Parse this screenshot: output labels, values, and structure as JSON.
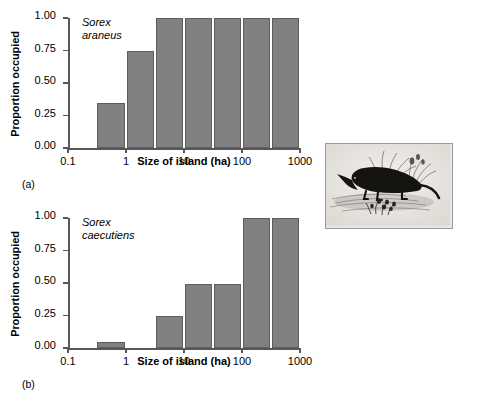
{
  "figure": {
    "panels": [
      {
        "letter": "(a)",
        "species_line1": "Sorex",
        "species_line2": "araneus",
        "xlabel": "Size of island (ha)",
        "ylabel": "Proportion occupied"
      },
      {
        "letter": "(b)",
        "species_line1": "Sorex",
        "species_line2": "caecutiens",
        "xlabel": "Size of island (ha)",
        "ylabel": "Proportion occupied"
      }
    ],
    "illustration": {
      "caption": "shrew-illustration"
    }
  },
  "chart_data": [
    {
      "type": "bar",
      "title": "Sorex araneus",
      "xlabel": "Size of island (ha)",
      "ylabel": "Proportion occupied",
      "xscale": "log",
      "xlim": [
        0.1,
        1000
      ],
      "ylim": [
        0.0,
        1.0
      ],
      "grid": false,
      "xticks": [
        0.1,
        1,
        10,
        100,
        1000
      ],
      "xtick_labels": [
        "0.1",
        "1",
        "10",
        "100",
        "1000"
      ],
      "yticks": [
        0.0,
        0.25,
        0.5,
        0.75,
        1.0
      ],
      "ytick_labels": [
        "0.00",
        "0.25",
        "0.50",
        "0.75",
        "1.00"
      ],
      "bins": [
        {
          "label": "0.3-1",
          "x_start": 0.3,
          "x_end": 1.0
        },
        {
          "label": "1-3",
          "x_start": 1.0,
          "x_end": 3.2
        },
        {
          "label": "3-10",
          "x_start": 3.2,
          "x_end": 10.0
        },
        {
          "label": "10-32",
          "x_start": 10.0,
          "x_end": 32.0
        },
        {
          "label": "32-100",
          "x_start": 32.0,
          "x_end": 100.0
        },
        {
          "label": "100-320",
          "x_start": 100.0,
          "x_end": 320.0
        },
        {
          "label": "320-1000",
          "x_start": 320.0,
          "x_end": 1000.0
        }
      ],
      "values": [
        0.35,
        0.75,
        1.0,
        1.0,
        1.0,
        1.0,
        1.0
      ],
      "bar_color": "#808082",
      "bar_edge_color": "#5d5d5f"
    },
    {
      "type": "bar",
      "title": "Sorex caecutiens",
      "xlabel": "Size of island (ha)",
      "ylabel": "Proportion occupied",
      "xscale": "log",
      "xlim": [
        0.1,
        1000
      ],
      "ylim": [
        0.0,
        1.0
      ],
      "grid": false,
      "xticks": [
        0.1,
        1,
        10,
        100,
        1000
      ],
      "xtick_labels": [
        "0.1",
        "1",
        "10",
        "100",
        "1000"
      ],
      "yticks": [
        0.0,
        0.25,
        0.5,
        0.75,
        1.0
      ],
      "ytick_labels": [
        "0.00",
        "0.25",
        "0.50",
        "0.75",
        "1.00"
      ],
      "bins": [
        {
          "label": "0.3-1",
          "x_start": 0.3,
          "x_end": 1.0
        },
        {
          "label": "1-3",
          "x_start": 1.0,
          "x_end": 3.2
        },
        {
          "label": "3-10",
          "x_start": 3.2,
          "x_end": 10.0
        },
        {
          "label": "10-32",
          "x_start": 10.0,
          "x_end": 32.0
        },
        {
          "label": "32-100",
          "x_start": 32.0,
          "x_end": 100.0
        },
        {
          "label": "100-320",
          "x_start": 100.0,
          "x_end": 320.0
        },
        {
          "label": "320-1000",
          "x_start": 320.0,
          "x_end": 1000.0
        }
      ],
      "values": [
        0.05,
        0.0,
        0.25,
        0.49,
        0.49,
        1.0,
        1.0
      ],
      "bar_color": "#808082",
      "bar_edge_color": "#5d5d5f"
    }
  ]
}
